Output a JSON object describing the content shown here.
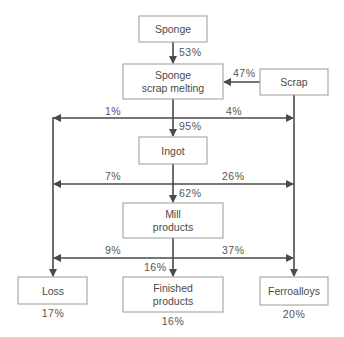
{
  "diagram": {
    "nodes": {
      "sponge": {
        "label": [
          "Sponge"
        ]
      },
      "melting": {
        "label": [
          "Sponge",
          "scrap melting"
        ]
      },
      "scrap": {
        "label": [
          "Scrap"
        ]
      },
      "ingot": {
        "label": [
          "Ingot"
        ]
      },
      "mill": {
        "label": [
          "Mill",
          "products"
        ]
      },
      "loss": {
        "label": [
          "Loss"
        ],
        "share": "17%"
      },
      "finished": {
        "label": [
          "Finished",
          "products"
        ],
        "share": "16%"
      },
      "ferroalloys": {
        "label": [
          "Ferroalloys"
        ],
        "share": "20%"
      }
    },
    "edges": {
      "sponge_to_melting": "53%",
      "scrap_to_melting": "47%",
      "melting_to_loss": "1%",
      "melting_to_ferro": "4%",
      "melting_to_ingot": "95%",
      "ingot_to_loss": "7%",
      "ingot_to_ferro": "26%",
      "ingot_to_mill": "62%",
      "mill_to_loss": "9%",
      "mill_to_ferro": "37%",
      "mill_to_finished": "16%"
    }
  }
}
